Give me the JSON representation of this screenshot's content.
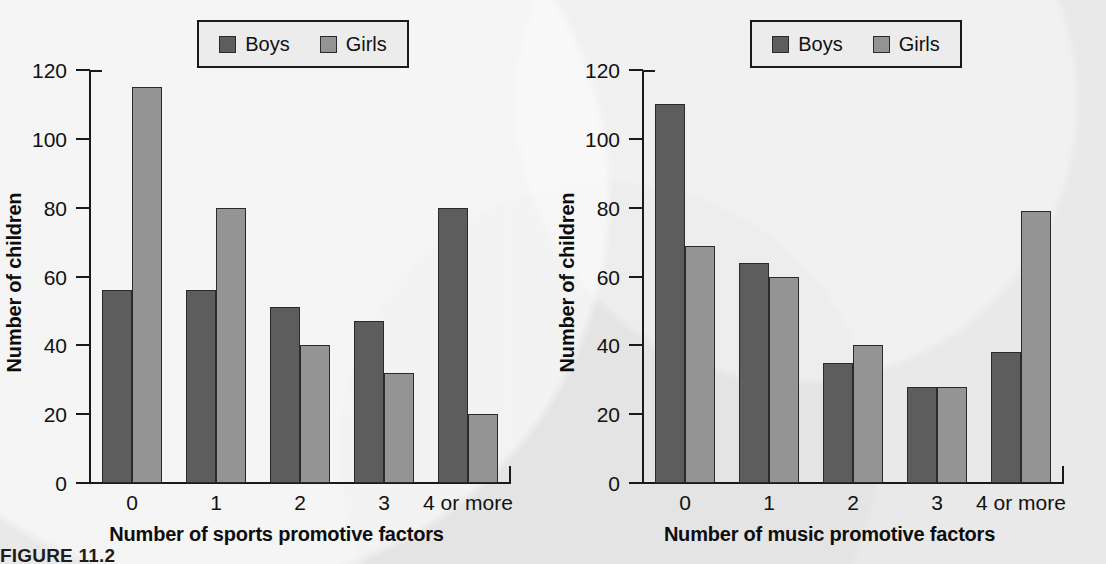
{
  "figure": {
    "caption": "FIGURE 11.2"
  },
  "legend": {
    "boys_label": "Boys",
    "girls_label": "Girls",
    "boys_color": "#5d5d5d",
    "girls_color": "#949494",
    "position": "top-center"
  },
  "axis": {
    "y_title": "Number of children",
    "y_ticks": [
      "0",
      "20",
      "40",
      "60",
      "80",
      "100",
      "120"
    ],
    "y_min": 0,
    "y_max": 120
  },
  "chart_data": [
    {
      "type": "bar",
      "id": "sports",
      "title": "",
      "xlabel": "Number of sports promotive factors",
      "ylabel": "Number of children",
      "categories": [
        "0",
        "1",
        "2",
        "3",
        "4 or more"
      ],
      "series": [
        {
          "name": "Boys",
          "values": [
            56,
            56,
            51,
            47,
            80
          ]
        },
        {
          "name": "Girls",
          "values": [
            115,
            80,
            40,
            32,
            20
          ]
        }
      ],
      "ylim": [
        0,
        120
      ],
      "yticks": [
        0,
        20,
        40,
        60,
        80,
        100,
        120
      ],
      "grid": false,
      "legend_position": "top-center"
    },
    {
      "type": "bar",
      "id": "music",
      "title": "",
      "xlabel": "Number of music promotive factors",
      "ylabel": "Number of children",
      "categories": [
        "0",
        "1",
        "2",
        "3",
        "4 or more"
      ],
      "series": [
        {
          "name": "Boys",
          "values": [
            110,
            64,
            35,
            28,
            38
          ]
        },
        {
          "name": "Girls",
          "values": [
            69,
            60,
            40,
            28,
            79
          ]
        }
      ],
      "ylim": [
        0,
        120
      ],
      "yticks": [
        0,
        20,
        40,
        60,
        80,
        100,
        120
      ],
      "grid": false,
      "legend_position": "top-center"
    }
  ]
}
